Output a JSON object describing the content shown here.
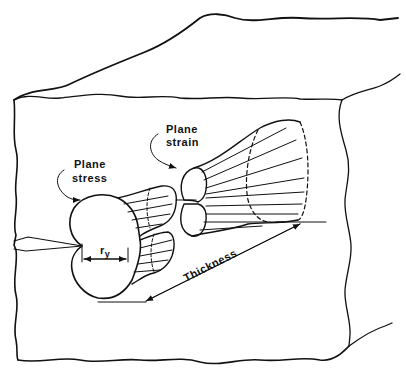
{
  "diagram": {
    "labels": {
      "plane_stress_line1": "Plane",
      "plane_stress_line2": "stress",
      "plane_strain_line1": "Plane",
      "plane_strain_line2": "strain",
      "ry_main": "r",
      "ry_sub": "y",
      "thickness": "Thickness"
    },
    "colors": {
      "line": "#111111",
      "background": "#ffffff",
      "hatch": "#222222"
    }
  }
}
